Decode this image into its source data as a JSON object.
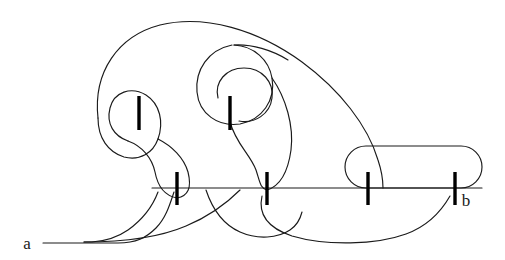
{
  "figure": {
    "kind": "knot-tangle-diagram",
    "title": "",
    "background_color": "#ffffff",
    "stroke_color": "#1a1a1a",
    "tick_color": "#000000",
    "width": 505,
    "height": 260,
    "labels": [
      {
        "id": "a",
        "text": "a",
        "x": 30,
        "y": 248,
        "role": "left-endpoint-label"
      },
      {
        "id": "b",
        "text": "b",
        "x": 464,
        "y": 205,
        "role": "right-endpoint-label"
      }
    ],
    "ticks": [
      {
        "id": "tick-upper-left",
        "x": 139,
        "y_top": 96,
        "y_bottom": 130
      },
      {
        "id": "tick-upper-mid",
        "x": 230,
        "y_top": 96,
        "y_bottom": 130
      },
      {
        "id": "tick-base-1",
        "x": 177,
        "y_top": 172,
        "y_bottom": 205
      },
      {
        "id": "tick-base-2",
        "x": 267,
        "y_top": 172,
        "y_bottom": 205
      },
      {
        "id": "tick-base-3",
        "x": 368,
        "y_top": 172,
        "y_bottom": 205
      },
      {
        "id": "tick-base-4",
        "x": 455,
        "y_top": 172,
        "y_bottom": 205
      }
    ],
    "baseline": {
      "y": 188,
      "x_start": 150,
      "x_end": 482
    },
    "rounded_loop": {
      "x": 344,
      "y": 146,
      "width": 138,
      "height": 42,
      "radius": 21
    },
    "strand_count": 9,
    "paths": {
      "baseline": "M 150 188 L 482 188",
      "rounded_loop": "M 365 146 L 461 146 A 21 21 0 0 1 461 188 L 365 188 A 21 21 0 0 1 365 146 Z",
      "outer_big_arc": "M 99 100 C 99 36, 150 18, 200 22 C 260 27, 330 60, 360 110 C 375 136, 379 160, 380 182",
      "left_outer_lobe": "M 99 100 C 99 124, 110 137, 128 140 C 146 143, 160 134, 166 120 C 172 106, 166 90, 150 84 C 132 78, 118 88, 118 104 C 118 120, 127 131, 141 138 C 160 147, 173 160, 176 176",
      "left_inner_drop": "M 166 120 C 174 146, 192 150, 199 168 C 205 184, 196 196, 181 197 C 166 198, 158 187, 158 176",
      "mid_outer_lobe": "M 210 60 C 222 28, 262 26, 278 56 C 292 82, 276 112, 252 118 C 228 124, 210 108, 210 88 C 210 70, 222 58, 239 58",
      "mid_inner_lobe": "M 222 86 C 222 70, 235 62, 250 66 C 266 70, 276 86, 271 102 C 266 118, 248 124, 236 116",
      "mid_drop_right": "M 278 76 C 292 104, 298 136, 288 160 C 280 180, 262 192, 248 186",
      "mid_drop_left": "M 230 122 C 234 148, 248 156, 256 172 C 262 186, 254 196, 240 195",
      "bottom_left_tail": "M 22 243 L 110 243 C 130 243, 140 240, 152 232 C 166 222, 170 206, 177 192",
      "bottom_s_left": "M 168 192 C 156 212, 140 222, 122 231 C 108 238, 96 242, 80 243",
      "bottom_mid_cross": "M 185 190 C 200 208, 212 226, 236 234 C 254 240, 268 238, 280 231 C 292 224, 300 206, 300 192",
      "bottom_right_tail": "M 258 194 C 254 214, 262 228, 286 236 C 320 246, 372 246, 404 236 C 424 230, 438 216, 448 198"
    }
  }
}
